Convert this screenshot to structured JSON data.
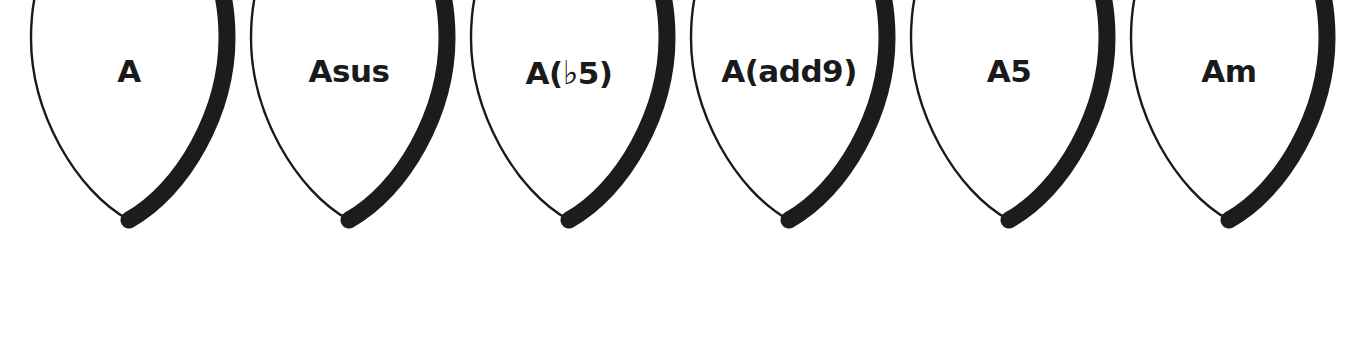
{
  "page": {
    "background_color": "#ffffff",
    "width": 1357,
    "height": 357,
    "ink_color": "#1a1a1a",
    "shadow_color": "#1c1c1c"
  },
  "picks": [
    {
      "id": "pick-a",
      "label": "A",
      "label_plain": "A",
      "has_flat": false,
      "x": 5
    },
    {
      "id": "pick-asus",
      "label": "Asus",
      "label_plain": "Asus",
      "has_flat": false,
      "x": 225
    },
    {
      "id": "pick-a-flat5",
      "label": "A(♭5)",
      "label_plain": "A(b5)",
      "has_flat": true,
      "flat_pre": "A(",
      "flat_glyph": "♭",
      "flat_post": "5)",
      "x": 445
    },
    {
      "id": "pick-a-add9",
      "label": "A(add9)",
      "label_plain": "A(add9)",
      "has_flat": false,
      "x": 665
    },
    {
      "id": "pick-a5",
      "label": "A5",
      "label_plain": "A5",
      "has_flat": false,
      "x": 885
    },
    {
      "id": "pick-am",
      "label": "Am",
      "label_plain": "Am",
      "has_flat": false,
      "x": 1105
    }
  ]
}
